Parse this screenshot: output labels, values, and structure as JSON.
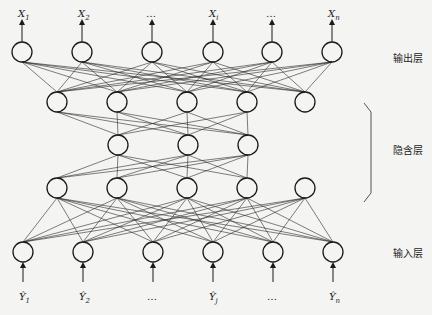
{
  "diagram": {
    "labels": {
      "output_layer": "输出层",
      "hidden_layer": "隐含层",
      "input_layer": "输入层"
    },
    "node_radius": 10,
    "layers": [
      {
        "id": "output",
        "y": 52,
        "x": [
          22,
          82,
          152,
          213,
          272,
          332
        ]
      },
      {
        "id": "hidden1",
        "y": 102,
        "x": [
          57,
          117,
          187,
          247,
          305
        ]
      },
      {
        "id": "hidden2",
        "y": 145,
        "x": [
          118,
          188,
          248
        ]
      },
      {
        "id": "hidden3",
        "y": 188,
        "x": [
          57,
          117,
          187,
          247,
          305
        ]
      },
      {
        "id": "input",
        "y": 252,
        "x": [
          23,
          83,
          153,
          213,
          273,
          333
        ]
      }
    ],
    "connections": [
      {
        "from": "hidden1",
        "to": "output",
        "type": "full"
      },
      {
        "from": "hidden1",
        "to": "hidden2",
        "type": "partial",
        "from_indices": [
          0,
          1,
          2,
          3
        ]
      },
      {
        "from": "hidden2",
        "to": "hidden3",
        "type": "partial",
        "to_indices": [
          0,
          1,
          2,
          3
        ]
      },
      {
        "from": "input",
        "to": "hidden3",
        "type": "full"
      }
    ],
    "output_vars": [
      {
        "base": "X",
        "sub": "1"
      },
      {
        "base": "X",
        "sub": "2"
      },
      {
        "base": "…",
        "sub": ""
      },
      {
        "base": "X",
        "sub": "i"
      },
      {
        "base": "…",
        "sub": ""
      },
      {
        "base": "X",
        "sub": "n"
      }
    ],
    "input_vars": [
      {
        "base": "Ŷ",
        "sub": "1"
      },
      {
        "base": "Ŷ",
        "sub": "2"
      },
      {
        "base": "…",
        "sub": ""
      },
      {
        "base": "Ŷ",
        "sub": "j"
      },
      {
        "base": "…",
        "sub": ""
      },
      {
        "base": "Ŷ",
        "sub": "n"
      }
    ]
  }
}
